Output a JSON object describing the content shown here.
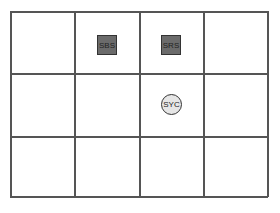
{
  "diagram": {
    "type": "grid-layout",
    "rows": 3,
    "columns": 4,
    "line_color": "#555555",
    "items": [
      {
        "label": "SBS",
        "shape": "square",
        "row": 0,
        "col": 1,
        "fill": "#6b6b6b"
      },
      {
        "label": "SRS",
        "shape": "square",
        "row": 0,
        "col": 2,
        "fill": "#6b6b6b"
      },
      {
        "label": "SYC",
        "shape": "circle",
        "row": 1,
        "col": 2,
        "fill": "#e6e6e6"
      }
    ]
  }
}
